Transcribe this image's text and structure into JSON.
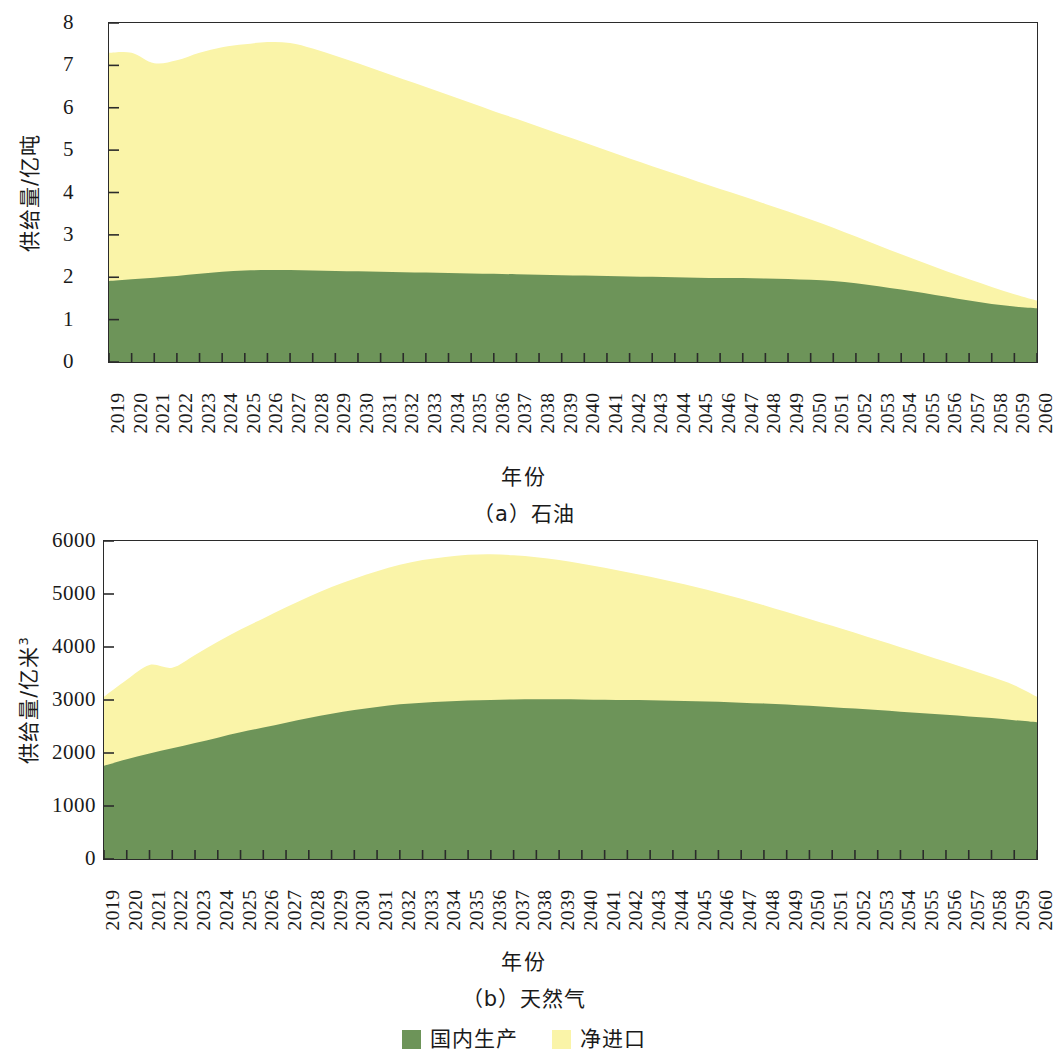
{
  "figure": {
    "legend": {
      "items": [
        {
          "label": "国内生产",
          "color": "#6d9459",
          "key": "domestic"
        },
        {
          "label": "净进口",
          "color": "#faf4a8",
          "key": "net_import"
        }
      ]
    }
  },
  "panel_a": {
    "subcaption": "（a）石油",
    "xlabel": "年份",
    "ylabel_main": "供给量/亿吨"
  },
  "panel_b": {
    "subcaption": "（b）天然气",
    "xlabel": "年份",
    "ylabel_main": "供给量/亿米",
    "ylabel_sup": "3"
  },
  "chart_data": [
    {
      "id": "panel_a",
      "type": "area",
      "stacked": true,
      "title": "（a）石油",
      "xlabel": "年份",
      "ylabel": "供给量/亿吨",
      "xlim": [
        2019,
        2060
      ],
      "ylim": [
        0,
        8
      ],
      "yticks": [
        0,
        1,
        2,
        3,
        4,
        5,
        6,
        7,
        8
      ],
      "ytick_labels": [
        "0",
        "1",
        "2",
        "3",
        "4",
        "5",
        "6",
        "7",
        "8"
      ],
      "grid": false,
      "legend_position": "below-figure",
      "categories": [
        2019,
        2020,
        2021,
        2022,
        2023,
        2024,
        2025,
        2026,
        2027,
        2028,
        2029,
        2030,
        2031,
        2032,
        2033,
        2034,
        2035,
        2036,
        2037,
        2038,
        2039,
        2040,
        2041,
        2042,
        2043,
        2044,
        2045,
        2046,
        2047,
        2048,
        2049,
        2050,
        2051,
        2052,
        2053,
        2054,
        2055,
        2056,
        2057,
        2058,
        2059,
        2060
      ],
      "xtick_labels": [
        "2019",
        "2020",
        "2021",
        "2022",
        "2023",
        "2024",
        "2025",
        "2026",
        "2027",
        "2028",
        "2029",
        "2030",
        "2031",
        "2032",
        "2033",
        "2034",
        "2035",
        "2036",
        "2037",
        "2038",
        "2039",
        "2040",
        "2041",
        "2042",
        "2043",
        "2044",
        "2045",
        "2046",
        "2047",
        "2048",
        "2049",
        "2050",
        "2051",
        "2052",
        "2053",
        "2054",
        "2055",
        "2056",
        "2057",
        "2058",
        "2059",
        "2060"
      ],
      "series": [
        {
          "name": "国内生产",
          "color": "#6d9459",
          "values": [
            1.91,
            1.95,
            1.99,
            2.03,
            2.08,
            2.13,
            2.16,
            2.17,
            2.17,
            2.16,
            2.15,
            2.14,
            2.13,
            2.12,
            2.11,
            2.1,
            2.09,
            2.08,
            2.07,
            2.06,
            2.05,
            2.04,
            2.03,
            2.02,
            2.01,
            2.0,
            1.99,
            1.98,
            1.98,
            1.97,
            1.96,
            1.94,
            1.91,
            1.86,
            1.79,
            1.71,
            1.63,
            1.54,
            1.45,
            1.37,
            1.31,
            1.27
          ]
        },
        {
          "name": "净进口",
          "color": "#faf4a8",
          "values": [
            5.39,
            5.35,
            5.06,
            5.09,
            5.22,
            5.3,
            5.34,
            5.38,
            5.36,
            5.24,
            5.08,
            4.91,
            4.73,
            4.55,
            4.38,
            4.2,
            4.02,
            3.84,
            3.67,
            3.49,
            3.31,
            3.14,
            2.96,
            2.78,
            2.61,
            2.44,
            2.27,
            2.1,
            1.93,
            1.76,
            1.59,
            1.42,
            1.26,
            1.1,
            0.96,
            0.83,
            0.71,
            0.6,
            0.5,
            0.4,
            0.29,
            0.18
          ]
        }
      ],
      "totals": [
        7.3,
        7.3,
        7.05,
        7.12,
        7.3,
        7.43,
        7.5,
        7.55,
        7.53,
        7.4,
        7.23,
        7.05,
        6.86,
        6.67,
        6.49,
        6.3,
        6.11,
        5.92,
        5.74,
        5.55,
        5.36,
        5.18,
        4.99,
        4.8,
        4.62,
        4.44,
        4.26,
        4.08,
        3.91,
        3.73,
        3.55,
        3.36,
        3.17,
        2.96,
        2.75,
        2.54,
        2.34,
        2.14,
        1.95,
        1.77,
        1.6,
        1.45
      ]
    },
    {
      "id": "panel_b",
      "type": "area",
      "stacked": true,
      "title": "（b）天然气",
      "xlabel": "年份",
      "ylabel": "供给量/亿米³",
      "xlim": [
        2019,
        2060
      ],
      "ylim": [
        0,
        6000
      ],
      "yticks": [
        0,
        1000,
        2000,
        3000,
        4000,
        5000,
        6000
      ],
      "ytick_labels": [
        "0",
        "1000",
        "2000",
        "3000",
        "4000",
        "5000",
        "6000"
      ],
      "grid": false,
      "legend_position": "below-figure",
      "categories": [
        2019,
        2020,
        2021,
        2022,
        2023,
        2024,
        2025,
        2026,
        2027,
        2028,
        2029,
        2030,
        2031,
        2032,
        2033,
        2034,
        2035,
        2036,
        2037,
        2038,
        2039,
        2040,
        2041,
        2042,
        2043,
        2044,
        2045,
        2046,
        2047,
        2048,
        2049,
        2050,
        2051,
        2052,
        2053,
        2054,
        2055,
        2056,
        2057,
        2058,
        2059,
        2060
      ],
      "xtick_labels": [
        "2019",
        "2020",
        "2021",
        "2022",
        "2023",
        "2024",
        "2025",
        "2026",
        "2027",
        "2028",
        "2029",
        "2030",
        "2031",
        "2032",
        "2033",
        "2034",
        "2035",
        "2036",
        "2037",
        "2038",
        "2039",
        "2040",
        "2041",
        "2042",
        "2043",
        "2044",
        "2045",
        "2046",
        "2047",
        "2048",
        "2049",
        "2050",
        "2051",
        "2052",
        "2053",
        "2054",
        "2055",
        "2056",
        "2057",
        "2058",
        "2059",
        "2060"
      ],
      "series": [
        {
          "name": "国内生产",
          "color": "#6d9459",
          "values": [
            1760,
            1880,
            1990,
            2090,
            2190,
            2290,
            2390,
            2480,
            2570,
            2660,
            2740,
            2810,
            2870,
            2920,
            2950,
            2970,
            2990,
            3000,
            3010,
            3015,
            3015,
            3010,
            3005,
            3000,
            2995,
            2985,
            2975,
            2965,
            2950,
            2935,
            2915,
            2890,
            2865,
            2840,
            2810,
            2780,
            2750,
            2720,
            2690,
            2660,
            2620,
            2580
          ]
        },
        {
          "name": "净进口",
          "color": "#faf4a8",
          "values": [
            1300,
            1500,
            1670,
            1520,
            1660,
            1810,
            1940,
            2060,
            2180,
            2290,
            2390,
            2480,
            2560,
            2630,
            2690,
            2730,
            2750,
            2750,
            2720,
            2680,
            2625,
            2560,
            2490,
            2410,
            2330,
            2245,
            2155,
            2060,
            1960,
            1855,
            1745,
            1640,
            1535,
            1430,
            1320,
            1215,
            1110,
            1000,
            890,
            780,
            660,
            480
          ]
        }
      ],
      "totals": [
        3060,
        3380,
        3660,
        3610,
        3850,
        4100,
        4330,
        4540,
        4750,
        4950,
        5130,
        5290,
        5430,
        5550,
        5640,
        5700,
        5740,
        5750,
        5730,
        5695,
        5640,
        5570,
        5495,
        5410,
        5325,
        5230,
        5130,
        5025,
        4910,
        4790,
        4660,
        4530,
        4400,
        4270,
        4130,
        3995,
        3860,
        3720,
        3580,
        3440,
        3280,
        3060
      ]
    }
  ]
}
